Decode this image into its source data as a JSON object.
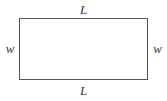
{
  "figure": {
    "name": "rectangle-with-length-and-width-labels",
    "type": "geometry-diagram",
    "background_color": "#ffffff",
    "shape": {
      "kind": "rectangle",
      "stroke_color": "#555555",
      "fill_color": "#ffffff",
      "stroke_width_px": 1.5,
      "x_px": 19,
      "y_px": 18,
      "width_px": 129,
      "height_px": 62
    },
    "labels": {
      "top": "L",
      "bottom": "L",
      "left": "w",
      "right": "w",
      "style": "italic-serif",
      "color": "#3a3a3a"
    }
  }
}
